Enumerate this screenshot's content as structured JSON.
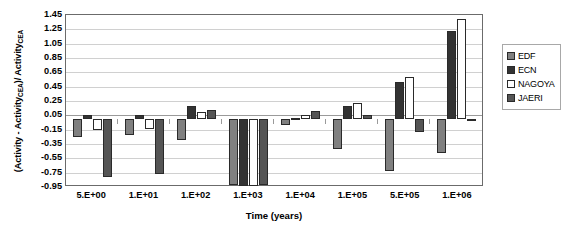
{
  "chart_data": {
    "type": "bar",
    "title": "",
    "xlabel": "Time (years)",
    "ylabel": "(Activity - Activity CEA)/ Activity CEA",
    "ylabel_parts": {
      "lead": "(Activity - Activity",
      "sub1": "CEA",
      "mid": ")/ Activity",
      "sub2": "CEA"
    },
    "categories": [
      "5.E+00",
      "1.E+01",
      "1.E+02",
      "1.E+03",
      "1.E+04",
      "1.E+05",
      "5.E+05",
      "1.E+06"
    ],
    "ylim": [
      -0.95,
      1.45
    ],
    "ytick_values": [
      1.45,
      1.25,
      1.05,
      0.85,
      0.65,
      0.45,
      0.25,
      0.05,
      -0.15,
      -0.35,
      -0.55,
      -0.75,
      -0.95
    ],
    "ytick_labels": [
      "1.45",
      "1.25",
      "1.05",
      "0.85",
      "0.65",
      "0.45",
      "0.25",
      "0.05",
      "-0.15",
      "-0.35",
      "-0.55",
      "-0.75",
      "-0.95"
    ],
    "grid": true,
    "legend_position": "right",
    "series": [
      {
        "name": "EDF",
        "color": "#808080",
        "values": [
          -0.25,
          -0.23,
          -0.29,
          -0.92,
          -0.08,
          -0.42,
          -0.72,
          -0.48
        ]
      },
      {
        "name": "ECN",
        "color": "#333333",
        "values": [
          0.05,
          0.06,
          0.18,
          -0.93,
          0.01,
          0.18,
          0.52,
          1.22
        ]
      },
      {
        "name": "NAGOYA",
        "color": "#ffffff",
        "values": [
          -0.15,
          -0.14,
          0.1,
          -0.93,
          0.05,
          0.22,
          0.58,
          1.4
        ]
      },
      {
        "name": "JAERI",
        "color": "#555555",
        "values": [
          -0.81,
          -0.77,
          0.12,
          -0.92,
          0.11,
          0.05,
          -0.18,
          -0.03
        ]
      }
    ]
  },
  "legend": {
    "items": [
      {
        "label": "EDF"
      },
      {
        "label": "ECN"
      },
      {
        "label": "NAGOYA"
      },
      {
        "label": "JAERI"
      }
    ]
  }
}
